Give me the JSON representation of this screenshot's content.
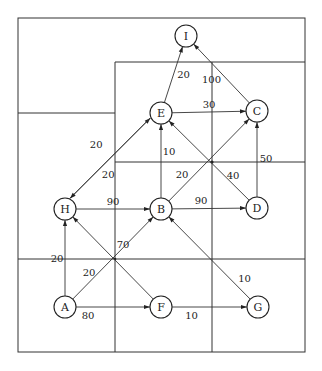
{
  "diagram": {
    "type": "directed-weighted-graph",
    "nodes": [
      {
        "id": "I",
        "label": "I"
      },
      {
        "id": "E",
        "label": "E"
      },
      {
        "id": "C",
        "label": "C"
      },
      {
        "id": "H",
        "label": "H"
      },
      {
        "id": "B",
        "label": "B"
      },
      {
        "id": "D",
        "label": "D"
      },
      {
        "id": "A",
        "label": "A"
      },
      {
        "id": "F",
        "label": "F"
      },
      {
        "id": "G",
        "label": "G"
      }
    ],
    "edges": [
      {
        "from": "E",
        "to": "I",
        "weight": "20"
      },
      {
        "from": "C",
        "to": "I",
        "weight": "100"
      },
      {
        "from": "E",
        "to": "C",
        "weight": "30"
      },
      {
        "from": "H",
        "to": "E",
        "weight": "20"
      },
      {
        "from": "E",
        "to": "H",
        "weight": "20"
      },
      {
        "from": "B",
        "to": "E",
        "weight": "10"
      },
      {
        "from": "D",
        "to": "E",
        "weight": "40"
      },
      {
        "from": "B",
        "to": "C",
        "weight": "20"
      },
      {
        "from": "D",
        "to": "C",
        "weight": "50"
      },
      {
        "from": "H",
        "to": "B",
        "weight": "90"
      },
      {
        "from": "B",
        "to": "D",
        "weight": "90"
      },
      {
        "from": "A",
        "to": "H",
        "weight": "20"
      },
      {
        "from": "F",
        "to": "H",
        "weight": "70"
      },
      {
        "from": "A",
        "to": "B",
        "weight": "20"
      },
      {
        "from": "G",
        "to": "B",
        "weight": "10"
      },
      {
        "from": "A",
        "to": "F",
        "weight": "80"
      },
      {
        "from": "F",
        "to": "G",
        "weight": "10"
      }
    ]
  }
}
